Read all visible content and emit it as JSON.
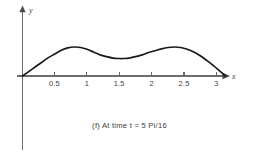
{
  "figure": {
    "caption": "(f) At time t = 5 Pi/16",
    "axis_x_label": "x",
    "axis_y_label": "y",
    "curve_color": "#1a1a1a",
    "axis_color": "#6b6b6b",
    "background_color": "#ffffff"
  },
  "chart_data": {
    "type": "line",
    "title": "(f) At time t = 5 Pi/16",
    "xlabel": "x",
    "ylabel": "y",
    "xlim": [
      0,
      3.3
    ],
    "ylim": [
      0,
      1.0
    ],
    "grid": false,
    "legend": null,
    "xticks": [
      0.5,
      1,
      1.5,
      2,
      2.5,
      3
    ],
    "xtick_labels": [
      "0.5",
      "1",
      "1.5",
      "2",
      "2.5",
      "3"
    ],
    "yticks": [],
    "ytick_labels": [],
    "series": [
      {
        "name": "u(x, 5Pi/16)",
        "x": [
          0.0,
          0.1,
          0.2,
          0.3,
          0.4,
          0.5,
          0.6,
          0.7,
          0.8,
          0.9,
          1.0,
          1.1,
          1.2,
          1.3,
          1.4,
          1.5,
          1.57,
          1.65,
          1.75,
          1.85,
          1.95,
          2.05,
          2.15,
          2.25,
          2.35,
          2.45,
          2.55,
          2.65,
          2.75,
          2.85,
          2.95,
          3.05,
          3.14
        ],
        "y": [
          0.0,
          0.1,
          0.2,
          0.3,
          0.4,
          0.48,
          0.56,
          0.61,
          0.63,
          0.62,
          0.58,
          0.52,
          0.46,
          0.42,
          0.39,
          0.38,
          0.38,
          0.39,
          0.42,
          0.46,
          0.51,
          0.55,
          0.59,
          0.62,
          0.63,
          0.62,
          0.58,
          0.52,
          0.44,
          0.34,
          0.23,
          0.11,
          0.0
        ]
      }
    ],
    "annotations": [
      {
        "label": "first crest",
        "x": 0.8,
        "y": 0.63
      },
      {
        "label": "trough between crests",
        "x": 1.55,
        "y": 0.38
      },
      {
        "label": "second crest",
        "x": 2.35,
        "y": 0.63
      }
    ]
  }
}
